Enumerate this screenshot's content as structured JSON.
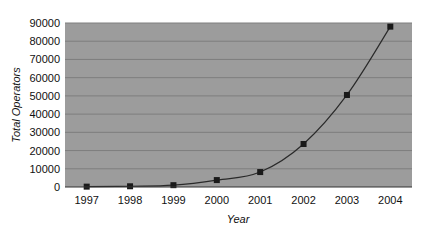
{
  "chart_data": {
    "type": "line",
    "title": "",
    "xlabel": "Year",
    "ylabel": "Total Operators",
    "categories": [
      "1997",
      "1998",
      "1999",
      "2000",
      "2001",
      "2002",
      "2003",
      "2004"
    ],
    "series": [
      {
        "name": "Total Operators",
        "values": [
          200,
          400,
          1000,
          3800,
          8200,
          23600,
          50500,
          88000
        ],
        "marker": "square"
      }
    ],
    "ylim": [
      0,
      90000
    ],
    "yticks": [
      0,
      10000,
      20000,
      30000,
      40000,
      50000,
      60000,
      70000,
      80000,
      90000
    ],
    "grid": true,
    "legend": "none"
  },
  "colors": {
    "plot_background": "#9c9c9c",
    "gridline": "#7e7e7e",
    "line": "#2a2a2a",
    "marker": "#1a1a1a"
  }
}
